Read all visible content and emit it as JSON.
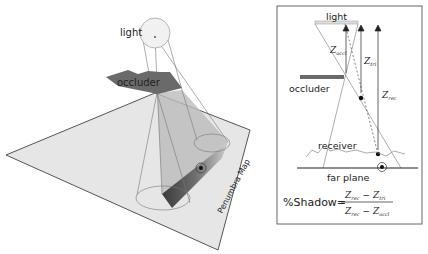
{
  "scene": {
    "light_label": "light",
    "occluder_label": "occluder",
    "plane_label": "Penumbra Map"
  },
  "inset": {
    "light_label": "light",
    "occluder_label": "occluder",
    "receiver_label": "receiver",
    "far_plane_label": "far plane",
    "z_occl": {
      "base": "Z",
      "sub": "occl"
    },
    "z_tri": {
      "base": "Z",
      "sub": "tri"
    },
    "z_rec": {
      "base": "Z",
      "sub": "rec"
    },
    "formula": {
      "lhs": "%Shadow",
      "equals": "=",
      "num_a": {
        "base": "Z",
        "sub": "rec"
      },
      "num_op": "−",
      "num_b": {
        "base": "Z",
        "sub": "tri"
      },
      "den_a": {
        "base": "Z",
        "sub": "rec"
      },
      "den_op": "−",
      "den_b": {
        "base": "Z",
        "sub": "occl"
      }
    }
  },
  "colors": {
    "plane_fill": "#e6e6e6",
    "plane_edge": "#555555",
    "occluder": "#6a6a6a",
    "shadow_volume": "#bdbdbd",
    "line": "#777777"
  }
}
